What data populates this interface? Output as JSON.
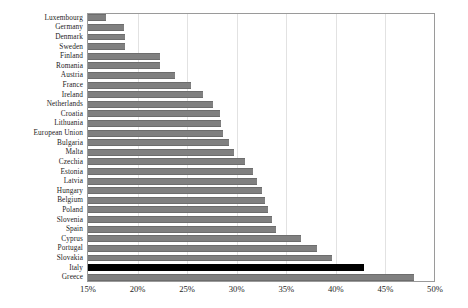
{
  "chart_data": {
    "type": "bar",
    "orientation": "horizontal",
    "title": "",
    "subtitle": "",
    "xlabel": "",
    "ylabel": "",
    "xlim": [
      15,
      50
    ],
    "xticks": [
      15,
      20,
      25,
      30,
      35,
      40,
      45,
      50
    ],
    "xtick_labels": [
      "15%",
      "20%",
      "25%",
      "30%",
      "35%",
      "40%",
      "45%",
      "50%"
    ],
    "grid": true,
    "grid_axis": "x",
    "legend": null,
    "legend_position": "none",
    "bar_color": "#808080",
    "highlight_color": "#000000",
    "highlight_category": "Italy",
    "categories": [
      "Luxembourg",
      "Germany",
      "Denmark",
      "Sweden",
      "Finland",
      "Romania",
      "Austria",
      "France",
      "Ireland",
      "Netherlands",
      "Croatia",
      "Lithuania",
      "European Union",
      "Bulgaria",
      "Malta",
      "Czechia",
      "Estonia",
      "Latvia",
      "Hungary",
      "Belgium",
      "Poland",
      "Slovenia",
      "Spain",
      "Cyprus",
      "Portugal",
      "Slovakia",
      "Italy",
      "Greece"
    ],
    "values": [
      16.8,
      18.6,
      18.7,
      18.7,
      22.3,
      22.3,
      23.8,
      25.4,
      26.6,
      27.6,
      28.3,
      28.4,
      28.6,
      29.2,
      29.7,
      30.8,
      31.6,
      32.0,
      32.5,
      32.9,
      33.2,
      33.6,
      34.0,
      36.5,
      38.1,
      39.6,
      42.8,
      47.9
    ],
    "value_unit": "%"
  }
}
